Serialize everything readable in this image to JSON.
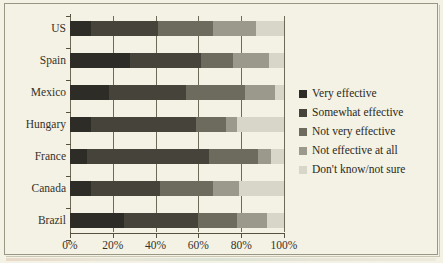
{
  "chart_data": {
    "type": "bar",
    "orientation": "horizontal",
    "stacked": true,
    "normalized_percent": true,
    "title": "",
    "subtitle": "",
    "xlabel": "",
    "ylabel": "",
    "xlim": [
      0,
      100
    ],
    "xticks": [
      "0%",
      "20%",
      "40%",
      "60%",
      "80%",
      "100%"
    ],
    "xtick_values": [
      0,
      20,
      40,
      60,
      80,
      100
    ],
    "grid": true,
    "grid_axis": "x",
    "legend_position": "right",
    "categories": [
      "US",
      "Spain",
      "Mexico",
      "Hungary",
      "France",
      "Canada",
      "Brazil"
    ],
    "series": [
      {
        "name": "Very effective",
        "color": "#2e2c26",
        "values": [
          10,
          28,
          18,
          10,
          8,
          10,
          25
        ]
      },
      {
        "name": "Somewhat effective",
        "color": "#46433a",
        "values": [
          31,
          33,
          36,
          49,
          57,
          32,
          35
        ]
      },
      {
        "name": "Not very effective",
        "color": "#6d6a5e",
        "values": [
          26,
          15,
          28,
          14,
          23,
          25,
          18
        ]
      },
      {
        "name": "Not effective at all",
        "color": "#9b998c",
        "values": [
          20,
          17,
          14,
          5,
          6,
          12,
          14
        ]
      },
      {
        "name": "Don't know/not sure",
        "color": "#d8d6c8",
        "values": [
          13,
          7,
          4,
          22,
          6,
          21,
          8
        ]
      }
    ]
  },
  "legend": {
    "items": [
      {
        "label": "Very effective",
        "color": "#2e2c26"
      },
      {
        "label": "Somewhat effective",
        "color": "#46433a"
      },
      {
        "label": "Not very effective",
        "color": "#6d6a5e"
      },
      {
        "label": "Not effective at all",
        "color": "#9b998c"
      },
      {
        "label": "Don't know/not sure",
        "color": "#d8d6c8"
      }
    ]
  },
  "axes": {
    "x_tick_labels": [
      "0%",
      "20%",
      "40%",
      "60%",
      "80%",
      "100%"
    ],
    "y_tick_labels": [
      "US",
      "Spain",
      "Mexico",
      "Hungary",
      "France",
      "Canada",
      "Brazil"
    ]
  },
  "style": {
    "background": "#f4f2e4",
    "frame_border": "#9a9684",
    "axis_color": "#56523f",
    "text_color": "#34312a"
  }
}
